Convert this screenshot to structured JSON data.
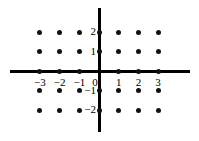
{
  "figure": {
    "width": 199,
    "height": 141,
    "background_color": "#ffffff",
    "axis_color": "#000000",
    "dot_color": "#111111"
  },
  "axes": {
    "origin_px": [
      99,
      71
    ],
    "x_spacing_px": 19.7,
    "y_spacing_px": 19.5,
    "x_axis": {
      "from_px": 10,
      "to_px": 190,
      "y_px": 71,
      "thickness_px": 3
    },
    "y_axis": {
      "from_px": 8,
      "to_px": 132,
      "x_px": 99,
      "thickness_px": 3
    },
    "x_tick_labels": [
      "−3",
      "−2",
      "−1",
      "0",
      "1",
      "2",
      "3"
    ],
    "x_tick_values": [
      -3,
      -2,
      -1,
      0,
      1,
      2,
      3
    ],
    "y_tick_labels": [
      "2",
      "1",
      "−1",
      "−2"
    ],
    "y_tick_values": [
      2,
      1,
      -1,
      -2
    ]
  },
  "chart_data": {
    "type": "scatter",
    "title": "",
    "subtitle": "",
    "xlabel": "",
    "ylabel": "",
    "xlim": [
      -3.6,
      3.6
    ],
    "ylim": [
      -2.6,
      2.6
    ],
    "xticks": [
      -3,
      -2,
      -1,
      0,
      1,
      2,
      3
    ],
    "yticks": [
      -2,
      -1,
      1,
      2
    ],
    "xticklabels": [
      "−3",
      "−2",
      "−1",
      "0",
      "1",
      "2",
      "3"
    ],
    "yticklabels": [
      "−2",
      "−1",
      "1",
      "2"
    ],
    "grid": false,
    "legend": false,
    "legend_position": "none",
    "marker": "filled-circle",
    "marker_size_px": 5,
    "annotations": [],
    "note": "All integer lattice points with -3<=x<=3 and -2<=y<=2 are plotted, except the origin (0,0) which is unmarked.",
    "series": [
      {
        "name": "lattice points",
        "color": "#111111",
        "points": [
          [
            -3,
            2
          ],
          [
            -2,
            2
          ],
          [
            -1,
            2
          ],
          [
            0,
            2
          ],
          [
            1,
            2
          ],
          [
            2,
            2
          ],
          [
            3,
            2
          ],
          [
            -3,
            1
          ],
          [
            -2,
            1
          ],
          [
            -1,
            1
          ],
          [
            0,
            1
          ],
          [
            1,
            1
          ],
          [
            2,
            1
          ],
          [
            3,
            1
          ],
          [
            -3,
            0
          ],
          [
            -2,
            0
          ],
          [
            -1,
            0
          ],
          [
            1,
            0
          ],
          [
            2,
            0
          ],
          [
            3,
            0
          ],
          [
            -3,
            -1
          ],
          [
            -2,
            -1
          ],
          [
            -1,
            -1
          ],
          [
            0,
            -1
          ],
          [
            1,
            -1
          ],
          [
            2,
            -1
          ],
          [
            3,
            -1
          ],
          [
            -3,
            -2
          ],
          [
            -2,
            -2
          ],
          [
            -1,
            -2
          ],
          [
            0,
            -2
          ],
          [
            1,
            -2
          ],
          [
            2,
            -2
          ],
          [
            3,
            -2
          ]
        ]
      }
    ]
  }
}
